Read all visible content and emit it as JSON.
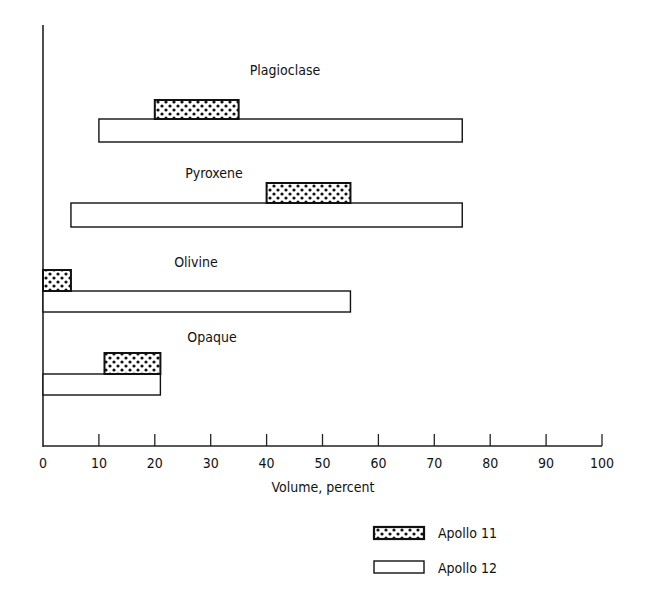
{
  "chart_data": {
    "type": "bar",
    "orientation": "horizontal",
    "subtype": "range",
    "title": "",
    "xlabel": "Volume, percent",
    "ylabel": "",
    "xlim": [
      0,
      100
    ],
    "xticks": [
      0,
      10,
      20,
      30,
      40,
      50,
      60,
      70,
      80,
      90,
      100
    ],
    "grid": false,
    "legend_position": "bottom-right",
    "categories": [
      "Plagioclase",
      "Pyroxene",
      "Olivine",
      "Opaque"
    ],
    "series": [
      {
        "name": "Apollo 11",
        "style": "dotted-pattern",
        "ranges": [
          [
            20,
            35
          ],
          [
            40,
            55
          ],
          [
            0,
            5
          ],
          [
            11,
            21
          ]
        ]
      },
      {
        "name": "Apollo 12",
        "style": "white",
        "ranges": [
          [
            10,
            75
          ],
          [
            5,
            75
          ],
          [
            0,
            55
          ],
          [
            0,
            21
          ]
        ]
      }
    ]
  },
  "legend": {
    "items": [
      {
        "label": "Apollo 11"
      },
      {
        "label": "Apollo 12"
      }
    ]
  }
}
